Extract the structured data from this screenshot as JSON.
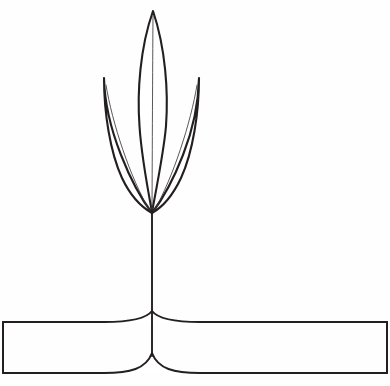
{
  "figure": {
    "kind": "line-art-illustration",
    "background_color": "#fefefe",
    "stroke_color": "#231f20",
    "vein_color": "#3b3a3c",
    "fill_color": "#ffffff",
    "canvas": {
      "width": 390,
      "height": 386
    },
    "elements": {
      "center_leaf": {
        "name": "center-leaf",
        "tip_x": 153,
        "tip_y": 11,
        "base_x": 152,
        "base_y": 212,
        "widest_left_x": 138,
        "widest_right_x": 167,
        "widest_y": 82,
        "path": "M153 11 C140 48 137 92 139.5 126 C141 150 146 180 152 212 C158 180 164 150 166 126 C168.5 92 165.5 48 153 11 Z",
        "vein_path": "M153 16 C152.6 70 152.3 150 152 210"
      },
      "left_leaf": {
        "name": "left-leaf",
        "tip_x": 104,
        "tip_y": 78,
        "base_x": 152,
        "base_y": 213,
        "path": "M104 78 C104 112 110 152 122 178 C131 197 143 208 152 213 C142 200 130 178 121 155 C110 127 104.5 100 104 78 Z",
        "vein_path": "M106 85 C112 122 130 178 150 211"
      },
      "right_leaf": {
        "name": "right-leaf",
        "tip_x": 199,
        "tip_y": 78,
        "base_x": 152,
        "base_y": 213,
        "path": "M199 78 C199 112 193 152 181 178 C172 197 161 208 152 213 C162 200 174 178 183 155 C194 127 198.5 100 199 78 Z",
        "vein_path": "M197 85 C191 122 173 178 154 211"
      },
      "stem": {
        "name": "stem",
        "top_x": 152,
        "top_y": 212,
        "bottom_y": 356,
        "path": "M152 212 L152 356"
      },
      "base_bar": {
        "name": "base-bar",
        "left_x": 3,
        "right_x": 387,
        "top_y": 322,
        "bottom_y": 373,
        "fillet_top_apex_y": 311,
        "fillet_bottom_apex_y": 353,
        "fillet_half_width": 48,
        "top_path": "M3 322 L104 322 C130 322 146 319 152 311 C158 319 174 322 200 322 L387 322",
        "bottom_path": "M3 373 L104 373 C130 373 146 369 152 353 C158 369 174 373 200 373 L387 373",
        "left_edge_path": "M3 322 L3 373",
        "right_edge_path": "M387 322 L387 373"
      }
    }
  }
}
